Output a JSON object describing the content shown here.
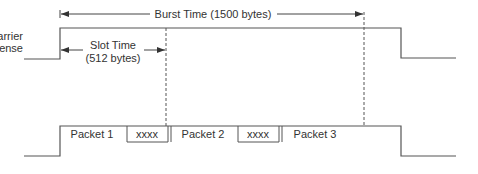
{
  "diagram": {
    "burst_label": "Burst Time (1500 bytes)",
    "carrier_label_line1": "Carrier",
    "carrier_label_line2": "Sense",
    "slot_label_line1": "Slot Time",
    "slot_label_line2": "(512 bytes)",
    "packets": [
      {
        "label": "Packet 1"
      },
      {
        "label": "xxxx"
      },
      {
        "label": "Packet 2"
      },
      {
        "label": "xxxx"
      },
      {
        "label": "Packet 3"
      }
    ],
    "colors": {
      "line": "#555555",
      "text": "#333333",
      "background": "#ffffff"
    }
  }
}
